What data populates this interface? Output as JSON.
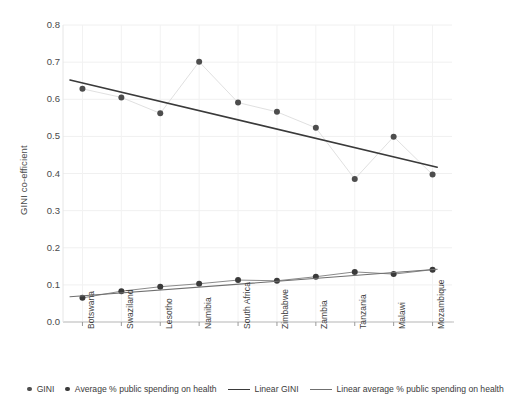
{
  "chart_data": {
    "type": "line",
    "title": "",
    "xlabel": "",
    "ylabel": "GINI co-efficient",
    "ylim": [
      0.0,
      0.8
    ],
    "ytick_labels": [
      "0.0",
      "0.1",
      "0.2",
      "0.3",
      "0.4",
      "0.5",
      "0.6",
      "0.7",
      "0.8"
    ],
    "ytick_values": [
      0.0,
      0.1,
      0.2,
      0.3,
      0.4,
      0.5,
      0.6,
      0.7,
      0.8
    ],
    "grid": true,
    "legend_position": "bottom",
    "categories": [
      "Botswana",
      "Swaziland",
      "Lesotho",
      "Namibia",
      "South Africa",
      "Zimbabwe",
      "Zambia",
      "Tanzania",
      "Malawi",
      "Mozambique"
    ],
    "series": [
      {
        "name": "GINI",
        "style": "marker",
        "color": "#4d4d4d",
        "values": [
          0.628,
          0.605,
          0.562,
          0.701,
          0.591,
          0.566,
          0.523,
          0.385,
          0.499,
          0.397
        ]
      },
      {
        "name": "Average % public spending on health",
        "style": "marker",
        "color": "#3a3a3a",
        "values": [
          0.065,
          0.083,
          0.095,
          0.103,
          0.113,
          0.111,
          0.122,
          0.135,
          0.129,
          0.141
        ]
      },
      {
        "name": "Linear GINI",
        "style": "trendline",
        "color": "#3a3a3a",
        "endpoints": [
          0.652,
          0.417
        ]
      },
      {
        "name": "Linear average % public spending on health",
        "style": "trendline",
        "color": "#6f6f6f",
        "endpoints": [
          0.068,
          0.142
        ]
      }
    ],
    "legend": [
      {
        "label": "GINI",
        "marker": "dot",
        "color": "#4d4d4d"
      },
      {
        "label": "Average % public spending on health",
        "marker": "dot",
        "color": "#3a3a3a"
      },
      {
        "label": "Linear GINI",
        "marker": "line",
        "color": "#3a3a3a"
      },
      {
        "label": "Linear average % public spending on health",
        "marker": "line",
        "color": "#6f6f6f"
      }
    ]
  }
}
